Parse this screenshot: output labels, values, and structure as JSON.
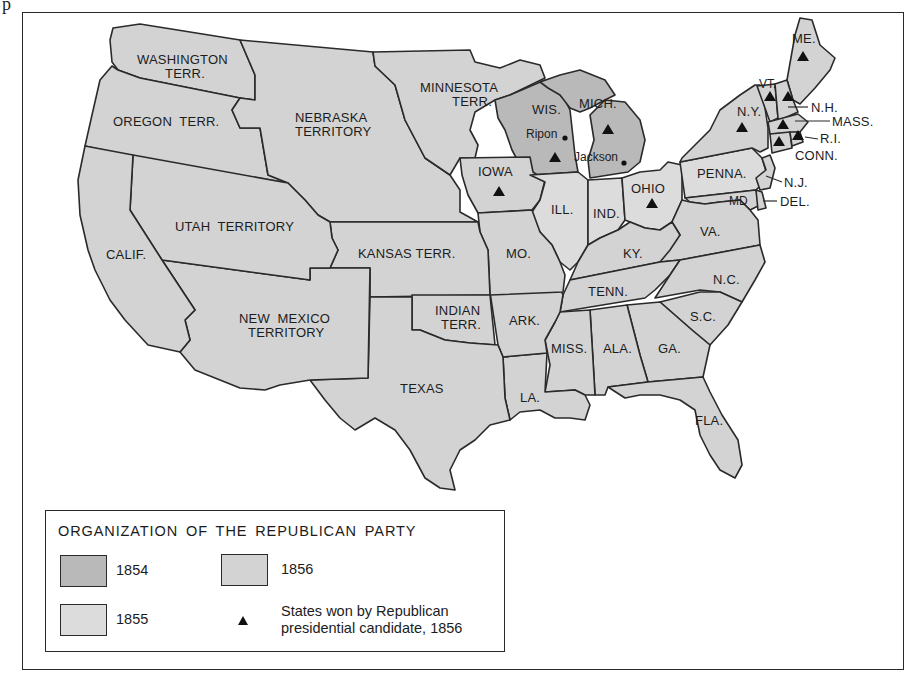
{
  "stray_mark": "p",
  "colors": {
    "y1854": "#b9b9b9",
    "y1855": "#dcdcdc",
    "y1856": "#d3d3d3",
    "border": "#2a2a2a",
    "water": "#ffffff",
    "marker": "#111111"
  },
  "legend": {
    "title": "ORGANIZATION OF THE REPUBLICAN PARTY",
    "items": [
      {
        "label": "1854"
      },
      {
        "label": "1855"
      },
      {
        "label": "1856"
      }
    ],
    "marker_label_line1": "States won by Republican",
    "marker_label_line2": "presidential candidate, 1856"
  },
  "regions": {
    "washington": "WASHINGTON",
    "washington2": "TERR.",
    "oregon": "OREGON  TERR.",
    "nebraska": "NEBRASKA",
    "nebraska2": "TERRITORY",
    "minnesota": "MINNESOTA",
    "minnesota2": "TERR.",
    "wis": "WIS.",
    "mich": "MICH.",
    "ripon": "Ripon",
    "jackson": "Jackson",
    "iowa": "IOWA",
    "ohio": "OHIO",
    "ill": "ILL.",
    "ind": "IND.",
    "utah": "UTAH  TERRITORY",
    "calif": "CALIF.",
    "kansas": "KANSAS TERR.",
    "mo": "MO.",
    "ky": "KY.",
    "va": "VA.",
    "nc": "N.C.",
    "tenn": "TENN.",
    "newmexico": "NEW  MEXICO",
    "newmexico2": "TERRITORY",
    "indian": "INDIAN",
    "indian2": "TERR.",
    "ark": "ARK.",
    "sc": "S.C.",
    "texas": "TEXAS",
    "miss": "MISS.",
    "ala": "ALA.",
    "ga": "GA.",
    "la": "LA.",
    "fla": "FLA.",
    "penna": "PENNA.",
    "ny": "N.Y.",
    "me": "ME.",
    "vt": "VT.",
    "nh": "N.H.",
    "mass": "MASS.",
    "ri": "R.I.",
    "conn": "CONN.",
    "nj": "N.J.",
    "md": "MD",
    "del": "DEL."
  },
  "states_won_1856": [
    "ME.",
    "VT.",
    "N.H.",
    "MASS.",
    "R.I.",
    "CONN.",
    "N.Y.",
    "OHIO",
    "MICH.",
    "WIS.",
    "IOWA"
  ]
}
